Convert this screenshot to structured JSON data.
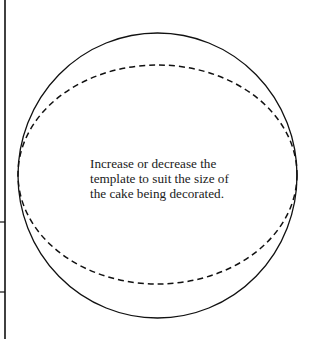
{
  "diagram": {
    "caption_lines": [
      "Increase or decrease the",
      "template to suit the size of",
      "the cake being decorated."
    ],
    "shapes": {
      "outer_ellipse": {
        "style": "solid",
        "cx": 157.5,
        "cy": 175.5,
        "rx": 139.5,
        "ry": 142.5
      },
      "inner_ellipse": {
        "style": "dashed",
        "cx": 157.5,
        "cy": 174.5,
        "rx": 139.5,
        "ry": 109.5
      },
      "left_rule": {
        "x": 5,
        "ticks_y": [
          222,
          292
        ]
      }
    },
    "colors": {
      "line": "#111111",
      "background": "#ffffff"
    }
  }
}
